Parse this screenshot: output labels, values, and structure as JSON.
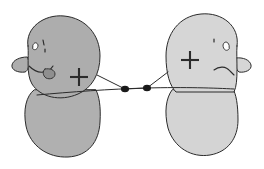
{
  "canvas": {
    "width": 264,
    "height": 169,
    "background_color": "#ffffff",
    "style": "hand-drawn line illustration",
    "title": "Two stylized figures facing each other joined by a connector with two nodes"
  },
  "palette": {
    "ink": "#2b2b2b",
    "ink_soft": "#3a3a3a",
    "left_fill": "#adadad",
    "left_body_fill": "#b0b0b0",
    "right_fill": "#d6d6d6",
    "right_body_fill": "#d4d4d4",
    "mouth_blob_fill": "#8f8f8f",
    "node_fill": "#1a1a1a",
    "white": "#ffffff"
  },
  "figures": [
    {
      "id": "left-figure",
      "name": "Left figure",
      "side": "left",
      "fill": "#adadad",
      "head": {
        "name": "left-head",
        "fill": "#adadad",
        "outline": "#2b2b2b",
        "path": "M 28 46 C 25 28, 44 14, 64 16 C 86 18, 100 35, 100 56 C 100 74, 92 88, 78 94 C 60 102, 40 97, 32 84 C 26 74, 29 58, 28 46 Z",
        "tilt_note": "tilted, leaning right"
      },
      "body": {
        "name": "left-body",
        "fill": "#b0b0b0",
        "outline": "#2b2b2b",
        "path": "M 34 90 C 26 96, 23 110, 26 126 C 30 146, 48 158, 68 157 C 88 156, 99 142, 100 122 C 101 106, 99 96, 96 90 Z"
      },
      "ear": {
        "name": "left-ear",
        "fill": "#adadad",
        "outline": "#2b2b2b",
        "path": "M 27 57 C 20 57, 13 60, 12 65 C 11 70, 18 73, 25 72 C 28 71, 29 66, 29 62 Z",
        "position": "left side of head"
      },
      "eyes": [
        {
          "name": "left-eye-outer",
          "shape": "small-almond",
          "path": "M 33 45 C 34 42, 37 42, 38 45 C 38 49, 35 51, 33 49 Z",
          "fill": "#ffffff",
          "outline": "#2b2b2b"
        },
        {
          "name": "left-eye-inner",
          "shape": "tick-mark",
          "path": "M 43 40 L 44 45 M 45 49 L 45 52",
          "fill": "none",
          "outline": "#2b2b2b"
        }
      ],
      "mouth": {
        "name": "left-mouth",
        "expression": "frown",
        "path": "M 29 66 C 34 71, 40 74, 47 71 C 50 70, 52 68, 53 66",
        "outline": "#2b2b2b"
      },
      "mouth_blob": {
        "name": "left-mouth-blob",
        "fill": "#8f8f8f",
        "outline": "#2b2b2b",
        "path": "M 45 69 C 50 68, 55 70, 55 74 C 55 78, 50 80, 46 78 C 43 76, 42 71, 45 69 Z"
      },
      "mark": {
        "name": "left-plus-mark",
        "symbol": "+",
        "cx": 79,
        "cy": 77,
        "arm": 9,
        "stroke_width": 2.1,
        "color": "#2b2b2b"
      }
    },
    {
      "id": "right-figure",
      "name": "Right figure",
      "side": "right",
      "fill": "#d6d6d6",
      "head": {
        "name": "right-head",
        "fill": "#d6d6d6",
        "outline": "#2b2b2b",
        "path": "M 237 46 C 240 26, 222 12, 201 14 C 179 16, 166 34, 166 56 C 166 74, 170 86, 176 92 L 234 92 C 239 82, 236 58, 237 46 Z",
        "tilt_note": "upright, slightly leaning left"
      },
      "body": {
        "name": "right-body",
        "fill": "#d4d4d4",
        "outline": "#2b2b2b",
        "path": "M 172 90 C 166 98, 164 112, 168 128 C 174 148, 192 158, 210 155 C 228 152, 238 138, 238 120 C 238 104, 236 94, 233 89 Z"
      },
      "ear": {
        "name": "right-ear",
        "fill": "#d6d6d6",
        "outline": "#2b2b2b",
        "path": "M 236 58 C 243 57, 250 60, 251 65 C 252 70, 245 73, 239 72 C 236 70, 235 64, 236 58 Z",
        "position": "right side of head"
      },
      "eyes": [
        {
          "name": "right-eye-outer",
          "shape": "small-almond",
          "path": "M 229 45 C 228 41, 224 41, 223 45 C 223 50, 227 52, 229 49 Z",
          "fill": "#ffffff",
          "outline": "#2b2b2b"
        },
        {
          "name": "right-eye-inner",
          "shape": "tick-mark",
          "path": "M 214 39 L 214 42",
          "fill": "none",
          "outline": "#2b2b2b"
        }
      ],
      "mouth": {
        "name": "right-mouth",
        "expression": "frown",
        "path": "M 214 70 C 219 66, 226 66, 230 71 C 232 73, 233 74, 234 75",
        "outline": "#2b2b2b"
      },
      "mark": {
        "name": "right-plus-mark",
        "symbol": "+",
        "cx": 190,
        "cy": 60,
        "arm": 9,
        "stroke_width": 2.1,
        "color": "#2b2b2b"
      }
    }
  ],
  "connector": {
    "name": "connector-link",
    "description": "V-shaped tether from left head to right head passing through two nodes, plus a long near-horizontal line crossing both bodies",
    "stroke": "#2b2b2b",
    "stroke_width": 1,
    "v_path": "M 97 75 L 125 89 L 147 88 L 168 72",
    "long_line_path": "M 37 95 C 70 92, 110 89, 147 88 C 185 87, 215 88, 234 89",
    "nodes": [
      {
        "name": "connector-node-left",
        "cx": 125,
        "cy": 89,
        "rx": 3.4,
        "ry": 2.6,
        "fill": "#1a1a1a"
      },
      {
        "name": "connector-node-right",
        "cx": 147,
        "cy": 88,
        "rx": 3.4,
        "ry": 2.6,
        "fill": "#1a1a1a"
      }
    ]
  },
  "accessibility": {
    "alt_text": "Hand-drawn illustration of two gray blob-shaped figures with faces, facing each other, joined by a line with two dots between them. Each figure has a plus sign drawn on its head."
  }
}
